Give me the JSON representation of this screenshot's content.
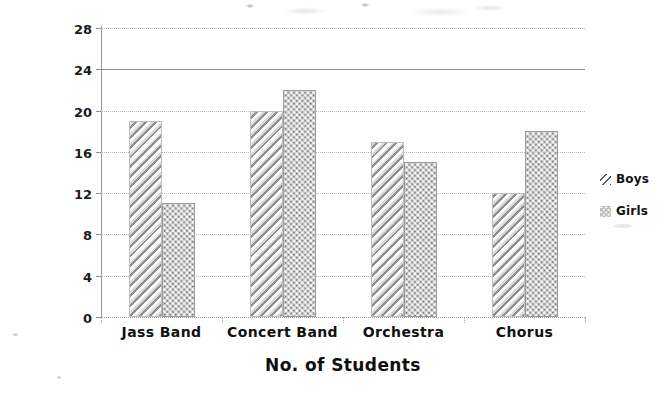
{
  "chart_data": {
    "type": "bar",
    "title": "",
    "categories": [
      "Jass Band",
      "Concert Band",
      "Orchestra",
      "Chorus"
    ],
    "series": [
      {
        "name": "Boys",
        "values": [
          19,
          20,
          17,
          12
        ],
        "pattern": "diagonal-hatch",
        "color": "#b0b0b0"
      },
      {
        "name": "Girls",
        "values": [
          11,
          22,
          15,
          18
        ],
        "pattern": "dotted-checker",
        "color": "#c9c9c9"
      }
    ],
    "xlabel": "No. of Students",
    "ylabel": "Music Activity",
    "ylim": [
      0,
      28
    ],
    "ytick_step": 4,
    "yticks": [
      0,
      4,
      8,
      12,
      16,
      20,
      24,
      28
    ],
    "grid": true,
    "grid_style": "dotted",
    "legend_position": "right"
  },
  "axes": {
    "y_title": "Music Activity",
    "x_title": "No. of Students",
    "y_tick_labels": [
      "28",
      "24",
      "20",
      "16",
      "12",
      "8",
      "4",
      "0"
    ]
  },
  "legend": {
    "items": [
      {
        "label": "Boys",
        "swatch": "diagonal-hatch-swatch"
      },
      {
        "label": "Girls",
        "swatch": "dotted-checker-swatch"
      }
    ]
  },
  "categories": [
    "Jass Band",
    "Concert Band",
    "Orchestra",
    "Chorus"
  ]
}
